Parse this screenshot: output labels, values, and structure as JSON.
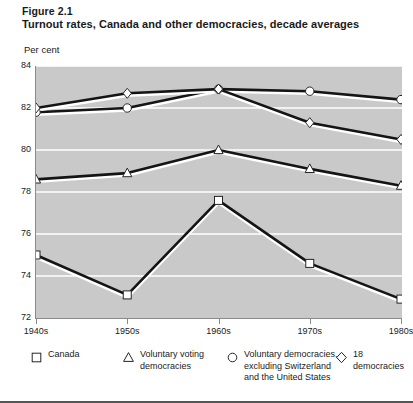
{
  "figure": {
    "number": "Figure 2.1",
    "title": "Turnout rates, Canada and other democracies, decade averages",
    "y_unit_label": "Per cent"
  },
  "chart_data": {
    "type": "line",
    "title": "Turnout rates, Canada and other democracies, decade averages",
    "subtitle": "Figure 2.1",
    "xlabel": "",
    "ylabel": "Per cent",
    "categories": [
      "1940s",
      "1950s",
      "1960s",
      "1970s",
      "1980s"
    ],
    "ylim": [
      72,
      84
    ],
    "yticks": [
      72,
      74,
      76,
      78,
      80,
      82,
      84
    ],
    "grid": true,
    "legend_position": "bottom",
    "series": [
      {
        "name": "Canada",
        "marker": "square",
        "values": [
          75.0,
          73.1,
          77.6,
          74.6,
          72.9
        ]
      },
      {
        "name": "Voluntary voting democracies",
        "marker": "triangle",
        "values": [
          78.6,
          78.9,
          80.0,
          79.1,
          78.3
        ]
      },
      {
        "name": "Voluntary democracies, excluding Switzerland and the United States",
        "marker": "circle",
        "values": [
          81.8,
          82.0,
          82.9,
          82.8,
          82.4
        ]
      },
      {
        "name": "18 democracies",
        "marker": "diamond",
        "values": [
          82.0,
          82.7,
          82.9,
          81.3,
          80.5
        ]
      }
    ]
  },
  "legend": {
    "items": [
      {
        "marker": "square",
        "label": "Canada"
      },
      {
        "marker": "triangle",
        "label": "Voluntary voting\ndemocracies"
      },
      {
        "marker": "circle",
        "label": "Voluntary democracies,\nexcluding Switzerland\nand the United States"
      },
      {
        "marker": "diamond",
        "label": "18 democracies"
      }
    ]
  },
  "colors": {
    "plot_background": "#c9c9c9",
    "gridline": "#ffffff",
    "line": "#141414",
    "line_highlight": "#ffffff",
    "marker_fill": "#ffffff",
    "marker_stroke": "#262626",
    "axis": "#8a8a8a",
    "text": "#1a1a1a"
  }
}
